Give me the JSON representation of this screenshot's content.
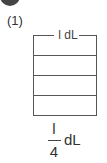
{
  "problem": {
    "label": "(1)",
    "container_caption": "l dL",
    "divisions": 4,
    "fraction": {
      "numerator": "l",
      "denominator": "4",
      "unit": "dL"
    }
  }
}
